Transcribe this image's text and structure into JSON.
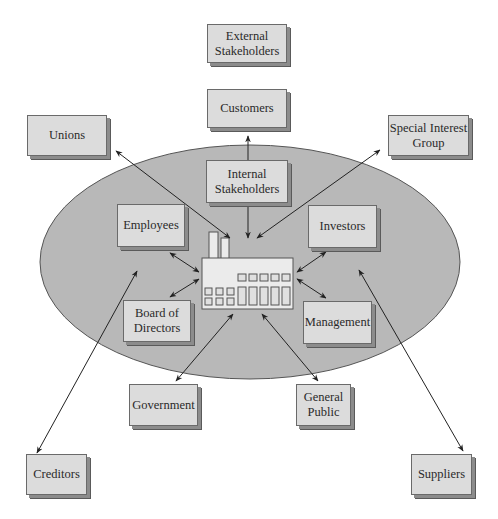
{
  "colors": {
    "ellipse_fill": "#b8b8b8",
    "ellipse_stroke": "#555555",
    "box_fill": "#dcdcdc",
    "arrow": "#222222",
    "factory_fill": "#ebebeb"
  },
  "nodes": {
    "external_stakeholders": "External\nStakeholders",
    "customers": "Customers",
    "unions": "Unions",
    "special_interest_group": "Special Interest\nGroup",
    "internal_stakeholders": "Internal\nStakeholders",
    "employees": "Employees",
    "investors": "Investors",
    "board_of_directors": "Board of\nDirectors",
    "management": "Management",
    "government": "Government",
    "general_public": "General\nPublic",
    "creditors": "Creditors",
    "suppliers": "Suppliers"
  },
  "center_icon": "factory-icon"
}
